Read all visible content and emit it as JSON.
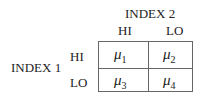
{
  "index2_label": "INDEX 2",
  "index1_label": "INDEX 1",
  "columns": [
    "HI",
    "LO"
  ],
  "rows": [
    "HI",
    "LO"
  ],
  "cells": [
    {
      "symbol": "μ",
      "sub": "1"
    },
    {
      "symbol": "μ",
      "sub": "2"
    },
    {
      "symbol": "μ",
      "sub": "3"
    },
    {
      "symbol": "μ",
      "sub": "4"
    }
  ]
}
